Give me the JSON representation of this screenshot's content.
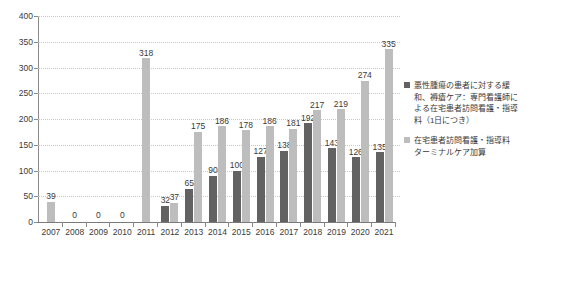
{
  "chart_data": {
    "type": "bar",
    "title": "",
    "subtitle": "",
    "xlabel": "",
    "ylabel": "",
    "ylim": [
      0,
      400
    ],
    "yticks": [
      0,
      50,
      100,
      150,
      200,
      250,
      300,
      350,
      400
    ],
    "grid": true,
    "legend_position": "right",
    "categories": [
      "2007",
      "2008",
      "2009",
      "2010",
      "2011",
      "2012",
      "2013",
      "2014",
      "2015",
      "2016",
      "2017",
      "2018",
      "2019",
      "2020",
      "2021"
    ],
    "series": [
      {
        "name": "悪性腫瘍の患者に対する緩和、褥瘡ケア：専門看護師による在宅患者訪問看護・指導料（1日につき）",
        "color": "#626262",
        "values": [
          null,
          null,
          null,
          null,
          null,
          32,
          65,
          90,
          100,
          127,
          138,
          192,
          143,
          126,
          135
        ],
        "labels": [
          "",
          "",
          "",
          "",
          "",
          "32",
          "65",
          "90",
          "100",
          "127",
          "138",
          "192",
          "143",
          "126",
          "135"
        ]
      },
      {
        "name": "在宅患者訪問看護・指導料 ターミナルケア加算",
        "color": "#bdbdbd",
        "values": [
          39,
          0,
          0,
          0,
          318,
          37,
          175,
          186,
          178,
          186,
          181,
          217,
          219,
          274,
          335
        ],
        "labels": [
          "39",
          "0",
          "0",
          "0",
          "318",
          "37",
          "175",
          "186",
          "178",
          "186",
          "181",
          "217",
          "219",
          "274",
          "335"
        ]
      }
    ],
    "zero_labels": {
      "2008": "0",
      "2009": "0",
      "2010": "0"
    }
  },
  "legend": {
    "entries": [
      {
        "swatch": "s1",
        "lines": [
          "悪性腫瘍の患者に対する緩",
          "和、褥瘡ケア：専門看護師に",
          "よる在宅患者訪問看護・指導",
          "料（1日につき）"
        ]
      },
      {
        "swatch": "s2",
        "lines": [
          "在宅患者訪問看護・指導料",
          "ターミナルケア加算"
        ]
      }
    ]
  },
  "axis": {
    "ytick_labels": [
      "400",
      "350",
      "300",
      "250",
      "200",
      "150",
      "100",
      "50",
      "0"
    ]
  }
}
